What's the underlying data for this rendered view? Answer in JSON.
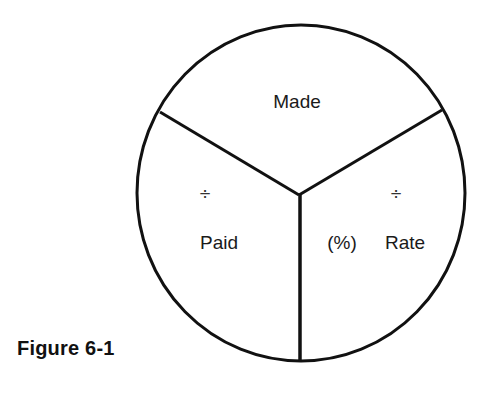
{
  "diagram": {
    "segments": {
      "top": "Made",
      "left": "Paid",
      "right": "Rate",
      "right_prefix": "(%)"
    },
    "operators": {
      "left": "÷",
      "right": "÷"
    },
    "caption": "Figure 6-1"
  }
}
